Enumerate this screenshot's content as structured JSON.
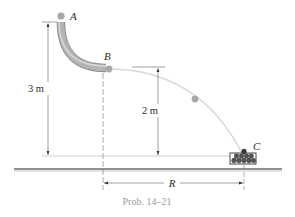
{
  "figure": {
    "caption": "Prob. 14–21",
    "points": {
      "A": {
        "label": "A"
      },
      "B": {
        "label": "B"
      },
      "C": {
        "label": "C"
      }
    },
    "dimensions": {
      "height_A": {
        "label": "3 m"
      },
      "height_B": {
        "label": "2 m"
      },
      "range": {
        "label": "R"
      }
    },
    "colors": {
      "tube": "#9c9c9c",
      "tube_highlight": "#d4d4d4",
      "ball": "#a8a8a8",
      "trajectory": "#d8d8d8",
      "dimension_line": "#555555",
      "ground": "#6e6e6e",
      "caption": "#9a9a9a"
    }
  }
}
